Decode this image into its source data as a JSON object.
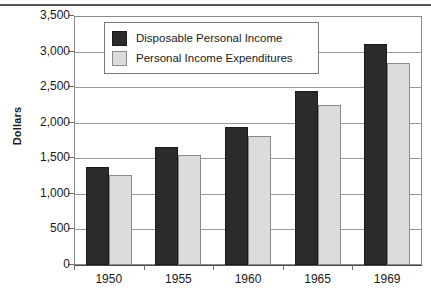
{
  "chart_data": {
    "type": "bar",
    "title": "",
    "subtitle": "",
    "xlabel": "",
    "ylabel": "Dollars",
    "categories": [
      "1950",
      "1955",
      "1960",
      "1965",
      "1969"
    ],
    "series": [
      {
        "name": "Disposable Personal Income",
        "color": "#2b2b2b",
        "values": [
          1375,
          1665,
          1945,
          2440,
          3110
        ]
      },
      {
        "name": "Personal Income Expenditures",
        "color": "#dcdcdc",
        "values": [
          1265,
          1545,
          1810,
          2250,
          2845
        ]
      }
    ],
    "ylim": [
      0,
      3500
    ],
    "ytick_values": [
      0,
      500,
      1000,
      1500,
      2000,
      2500,
      3000,
      3500
    ],
    "ytick_labels": [
      "0",
      "500",
      "1,000",
      "1,500",
      "2,000",
      "2,500",
      "3,000",
      "3,500"
    ],
    "grid": true,
    "grid_axis": "y",
    "legend_position": "upper-left-inside",
    "legend_entries": [
      "Disposable Personal Income",
      "Personal Income Expenditures"
    ]
  },
  "axes": {
    "y_title": "Dollars"
  },
  "legend": {
    "items": [
      {
        "label": "Disposable Personal Income",
        "swatch": "dark-swatch"
      },
      {
        "label": "Personal Income Expenditures",
        "swatch": "light-swatch"
      }
    ]
  },
  "colors": {
    "series_dark": "#2b2b2b",
    "series_light": "#dcdcdc",
    "gridline": "#9a9a9a",
    "frame": "#8a8a8a",
    "text": "#1a1a1a",
    "background": "#ffffff"
  }
}
